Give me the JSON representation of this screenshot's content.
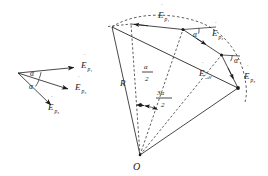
{
  "figure": {
    "background_color": "#ffffff",
    "stroke_color": "#1a1a1a",
    "left_panel": {
      "name": "individual-phasors",
      "description": "Three phasor vectors from a common origin separated by equal angles alpha",
      "origin": {
        "x": 18,
        "y": 73
      },
      "vectors": [
        {
          "label": "E",
          "dot": "̇",
          "sub": "p₁",
          "tip_x": 78,
          "tip_y": 68
        },
        {
          "label": "E",
          "dot": "̇",
          "sub": "p₂",
          "tip_x": 72,
          "tip_y": 90
        },
        {
          "label": "E",
          "dot": "̇",
          "sub": "p₃",
          "tip_x": 55,
          "tip_y": 108
        }
      ],
      "angles": [
        {
          "label": "α",
          "x": 34,
          "y": 72
        },
        {
          "label": "α",
          "x": 33,
          "y": 85
        }
      ]
    },
    "right_panel": {
      "name": "resultant-construction",
      "description": "Chained phasors on a circular arc of radius R about centre O, with resultant",
      "center": {
        "label": "O",
        "x": 140,
        "y": 155
      },
      "radius_label": "R",
      "arc_note": "dashed circular arc through the phasor chain",
      "chain": [
        {
          "label": "E",
          "dot": "̇",
          "sub": "p₁",
          "from_x": 130,
          "from_y": 24,
          "to_x": 183,
          "to_y": 30
        },
        {
          "label": "E",
          "dot": "̇",
          "sub": "p₂",
          "from_x": 183,
          "from_y": 30,
          "to_x": 221,
          "to_y": 55
        },
        {
          "label": "E",
          "dot": "̇",
          "sub": "p₃",
          "from_x": 221,
          "from_y": 55,
          "to_x": 238,
          "to_y": 88
        }
      ],
      "resultant": {
        "label": "E",
        "dot": "̇",
        "sub": "ₑₖᴠ"
      },
      "angles": [
        {
          "label": "α",
          "x": 196,
          "y": 35
        },
        {
          "label": "α",
          "x": 229,
          "y": 60
        },
        {
          "numerator": "α",
          "denominator": "2",
          "x": 148,
          "y": 72
        },
        {
          "numerator": "3α",
          "denominator": "2",
          "x": 165,
          "y": 100
        }
      ]
    }
  }
}
